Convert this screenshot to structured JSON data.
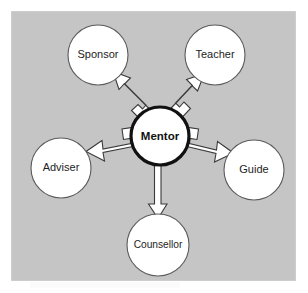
{
  "figure": {
    "type": "radial-concept-map",
    "background_color": "#ffffff",
    "panel_color": "#c5c5c5",
    "center_node": {
      "id": "mentor",
      "label": "Mentor",
      "bold": true,
      "fill": "#ffffff",
      "border_color": "#111111",
      "cx": 160,
      "cy": 136,
      "r": 29
    },
    "outer_nodes": [
      {
        "id": "sponsor",
        "label": "Sponsor",
        "fill": "#ffffff",
        "border_color": "#5b5b5b",
        "cx": 98,
        "cy": 55,
        "r": 30,
        "direction": "up-left"
      },
      {
        "id": "teacher",
        "label": "Teacher",
        "fill": "#ffffff",
        "border_color": "#5b5b5b",
        "cx": 215,
        "cy": 55,
        "r": 30,
        "direction": "up-right"
      },
      {
        "id": "adviser",
        "label": "Adviser",
        "fill": "#ffffff",
        "border_color": "#5b5b5b",
        "cx": 61,
        "cy": 168,
        "r": 30,
        "direction": "left"
      },
      {
        "id": "guide",
        "label": "Guide",
        "fill": "#ffffff",
        "border_color": "#5b5b5b",
        "cx": 254,
        "cy": 170,
        "r": 30,
        "direction": "right"
      },
      {
        "id": "counsellor",
        "label": "Counsellor",
        "fill": "#ffffff",
        "border_color": "#5b5b5b",
        "cx": 158,
        "cy": 245,
        "r": 31,
        "direction": "down"
      }
    ],
    "arrows": {
      "count": 5,
      "style": "white block arrow with dark outline",
      "fill": "#ffffff",
      "stroke": "#3a3a3a",
      "from": "Mentor",
      "to": [
        "Sponsor",
        "Teacher",
        "Adviser",
        "Guide",
        "Counsellor"
      ]
    }
  }
}
